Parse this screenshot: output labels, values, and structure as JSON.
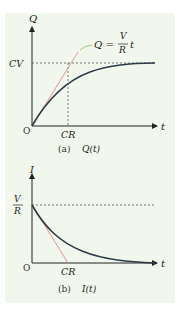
{
  "panel_a": {
    "y_axis_label": "Q",
    "x_axis_label": "t",
    "origin_label": "O",
    "y_mark_label": "CV",
    "x_mark_label": "CR",
    "tangent_eq_lhs": "Q =",
    "tangent_eq_num": "V",
    "tangent_eq_den": "R",
    "tangent_eq_var": "t",
    "caption_tag": "(a)",
    "caption_func": "Q(t)"
  },
  "panel_b": {
    "y_axis_label": "I",
    "x_axis_label": "t",
    "origin_label": "O",
    "y_mark_num": "V",
    "y_mark_den": "R",
    "x_mark_label": "CR",
    "caption_tag": "(b)",
    "caption_func": "I(t)"
  },
  "colors": {
    "background": "#f1f7ec",
    "curve": "#2e3a4a",
    "tangent": "#e08a8a",
    "leader": "#9ccc7a",
    "axis": "#222222",
    "guide": "#555555"
  }
}
